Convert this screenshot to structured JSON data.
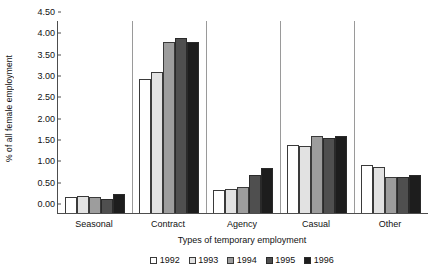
{
  "chart_data": {
    "type": "bar",
    "title": "",
    "xlabel": "Types of temporary employment",
    "ylabel": "% of all female employment",
    "categories": [
      "Seasonal",
      "Contract",
      "Agency",
      "Casual",
      "Other"
    ],
    "series": [
      {
        "name": "1992",
        "color": "#ffffff",
        "values": [
          0.37,
          3.15,
          0.55,
          1.6,
          1.13
        ]
      },
      {
        "name": "1993",
        "color": "#e2e2e2",
        "values": [
          0.4,
          3.3,
          0.57,
          1.58,
          1.08
        ]
      },
      {
        "name": "1994",
        "color": "#9d9d9d",
        "values": [
          0.37,
          4.0,
          0.62,
          1.8,
          0.85
        ]
      },
      {
        "name": "1995",
        "color": "#4f4f4f",
        "values": [
          0.33,
          4.1,
          0.88,
          1.75,
          0.85
        ]
      },
      {
        "name": "1996",
        "color": "#1d1d1d",
        "values": [
          0.44,
          4.0,
          1.05,
          1.8,
          0.88
        ]
      }
    ],
    "ylim": [
      0.0,
      4.5
    ],
    "ytick_values": [
      0.0,
      0.5,
      1.0,
      1.5,
      2.0,
      2.5,
      3.0,
      3.5,
      4.0,
      4.5
    ],
    "ytick_labels": [
      "0.00",
      "0.50",
      "1.00",
      "1.50",
      "2.00",
      "2.50",
      "3.00",
      "3.50",
      "4.00",
      "4.50"
    ],
    "grid": false,
    "legend_position": "bottom"
  }
}
